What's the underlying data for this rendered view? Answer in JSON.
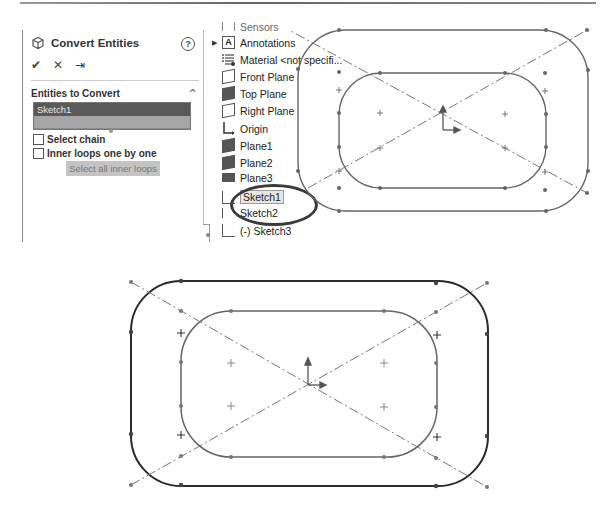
{
  "property_manager": {
    "title": "Convert Entities",
    "help_icon": "?",
    "actions": {
      "ok": "✔",
      "cancel": "✕",
      "pin": "⇥"
    },
    "section": {
      "title": "Entities to Convert",
      "collapse_icon": "^",
      "list_items": [
        "Sketch1"
      ]
    },
    "checkboxes": [
      {
        "label": "Select chain",
        "checked": false
      },
      {
        "label": "Inner loops one by one",
        "checked": false
      }
    ],
    "button_label": "Select all inner loops"
  },
  "feature_tree": {
    "items": [
      {
        "label": "Sensors",
        "icon": "sensors-icon"
      },
      {
        "label": "Annotations",
        "icon": "annotations-icon"
      },
      {
        "label": "Material <not specifi...",
        "icon": "material-icon"
      },
      {
        "label": "Front Plane",
        "icon": "plane-icon"
      },
      {
        "label": "Top Plane",
        "icon": "plane-icon"
      },
      {
        "label": "Right Plane",
        "icon": "plane-icon"
      },
      {
        "label": "Origin",
        "icon": "origin-icon"
      },
      {
        "label": "Plane1",
        "icon": "plane-icon"
      },
      {
        "label": "Plane2",
        "icon": "plane-icon"
      },
      {
        "label": "Plane3",
        "icon": "plane-icon"
      },
      {
        "label": "Sketch1",
        "icon": "sketch-icon"
      },
      {
        "label": "Sketch2",
        "icon": "sketch-icon"
      },
      {
        "label": "(-) Sketch3",
        "icon": "sketch-icon"
      }
    ],
    "selected": "Sketch1"
  },
  "colors": {
    "sketch_line": "#666666",
    "selected_sketch_line": "#2a2a2a",
    "list_selection": "#595959"
  }
}
